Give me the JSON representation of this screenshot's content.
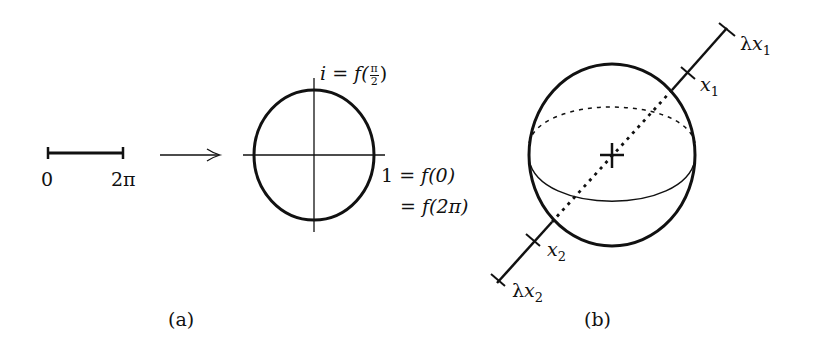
{
  "figure": {
    "panel_a": {
      "caption": "(a)",
      "interval": {
        "start_label": "0",
        "end_label": "2π"
      },
      "mapping_arrow": "right-arrow",
      "circle_labels": {
        "top": {
          "lhs": "i",
          "eq": "=",
          "func": "f(",
          "frac_num": "π",
          "frac_den": "2",
          "close": ")"
        },
        "right_line1": {
          "lhs": "1",
          "eq": "=",
          "rhs": "f(0)"
        },
        "right_line2": {
          "eq": "=",
          "rhs": "f(2π)"
        }
      }
    },
    "panel_b": {
      "caption": "(b)",
      "points": [
        {
          "name": "lambda-x1",
          "prefix": "λ",
          "var": "x",
          "sub": "1"
        },
        {
          "name": "x1",
          "prefix": "",
          "var": "x",
          "sub": "1"
        },
        {
          "name": "x2",
          "prefix": "",
          "var": "x",
          "sub": "2"
        },
        {
          "name": "lambda-x2",
          "prefix": "λ",
          "var": "x",
          "sub": "2"
        }
      ]
    }
  }
}
